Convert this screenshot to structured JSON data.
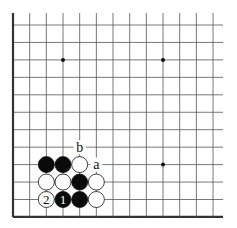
{
  "diagram": {
    "type": "go-board-fragment",
    "grid": {
      "columns": 13,
      "rows": 12,
      "x0": 13,
      "y0": 25,
      "spacing_x": 16.67,
      "spacing_y": 17.45,
      "edges": {
        "left": true,
        "bottom": true,
        "top": false,
        "right": false
      },
      "line_color": "#555555",
      "edge_color": "#333333"
    },
    "star_points": [
      {
        "col": 3,
        "row": 2
      },
      {
        "col": 9,
        "row": 2
      },
      {
        "col": 9,
        "row": 8
      }
    ],
    "stones": [
      {
        "col": 2,
        "row": 8,
        "color": "black",
        "label": ""
      },
      {
        "col": 3,
        "row": 8,
        "color": "black",
        "label": ""
      },
      {
        "col": 4,
        "row": 8,
        "color": "white",
        "label": ""
      },
      {
        "col": 2,
        "row": 9,
        "color": "white",
        "label": ""
      },
      {
        "col": 3,
        "row": 9,
        "color": "white",
        "label": ""
      },
      {
        "col": 4,
        "row": 9,
        "color": "black",
        "label": ""
      },
      {
        "col": 5,
        "row": 9,
        "color": "white",
        "label": ""
      },
      {
        "col": 2,
        "row": 10,
        "color": "white",
        "label": "2"
      },
      {
        "col": 3,
        "row": 10,
        "color": "black",
        "label": "1"
      },
      {
        "col": 4,
        "row": 10,
        "color": "black",
        "label": ""
      },
      {
        "col": 5,
        "row": 10,
        "color": "white",
        "label": ""
      }
    ],
    "point_labels": [
      {
        "col": 5,
        "row": 8,
        "text": "a"
      },
      {
        "col": 4,
        "row": 7,
        "text": "b"
      }
    ]
  }
}
